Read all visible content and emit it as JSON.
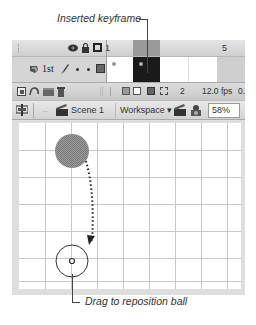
{
  "callouts": {
    "top": "Inserted keyframe",
    "bottom": "Drag to reposition ball"
  },
  "timeline": {
    "header": {
      "icons": [
        "eye-icon",
        "lock-icon",
        "outline-icon"
      ],
      "frame_labels": [
        {
          "frame": 1,
          "label": "1"
        },
        {
          "frame": 5,
          "label": "5"
        }
      ]
    },
    "layer": {
      "name": "1st",
      "icons": [
        "layer-icon",
        "pencil-icon",
        "visible-dot",
        "lock-dot",
        "outline-color-square"
      ],
      "keyframes": [
        1,
        2
      ],
      "selected_frame": 2
    },
    "footer": {
      "layer_buttons": [
        "new-layer-icon",
        "new-motion-guide-icon",
        "new-folder-icon",
        "delete-icon"
      ],
      "frame_buttons": [
        "onion-skin-icon",
        "onion-skin-outlines-icon",
        "edit-multiple-frames-icon",
        "modify-markers-icon"
      ],
      "current_frame": "2",
      "frame_rate": "12.0 fps",
      "elapsed": "0."
    }
  },
  "edit_bar": {
    "scene_label": "Scene 1",
    "workspace_label": "Workspace ▾",
    "zoom_value": "58%"
  },
  "colors": {
    "keyframe_selected": "#1a1a1a",
    "playhead": "#9a9a9a",
    "ball_fill": "#8c8c8c",
    "grid_line": "#c8c8c8"
  }
}
